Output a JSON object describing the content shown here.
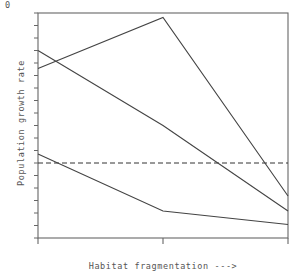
{
  "chart_data": {
    "type": "line",
    "title": "",
    "subtitle": "",
    "xlabel": "Habitat fragmentation --->",
    "ylabel": "Population growth rate",
    "x": [
      0,
      0.5,
      1
    ],
    "xlim": [
      0,
      1
    ],
    "ylim": [
      -0.5,
      1.0
    ],
    "grid": false,
    "legend": null,
    "xticks": [
      0,
      0.5,
      1
    ],
    "xticklabels": [
      "",
      "",
      ""
    ],
    "yticks": [
      0
    ],
    "yticklabels": [
      "0"
    ],
    "reference_line": {
      "name": "zero-line",
      "y": 0,
      "style": "dashed",
      "color": "#333333"
    },
    "series": [
      {
        "name": "series-1-hump",
        "values": [
          0.63,
          0.97,
          -0.22
        ],
        "color": "#444444"
      },
      {
        "name": "series-2-decline",
        "values": [
          0.75,
          0.25,
          -0.32
        ],
        "color": "#444444"
      },
      {
        "name": "series-3-low",
        "values": [
          0.06,
          -0.32,
          -0.41
        ],
        "color": "#444444"
      }
    ],
    "axes_geometry": {
      "left": 38,
      "right": 288,
      "top": 13,
      "bottom": 238,
      "zero_y_px": 171
    },
    "frame_color": "#666666",
    "text_color": "#555555"
  },
  "labels": {
    "y_axis": "Population growth rate",
    "x_axis": "Habitat fragmentation --->",
    "zero_tick": "0"
  }
}
